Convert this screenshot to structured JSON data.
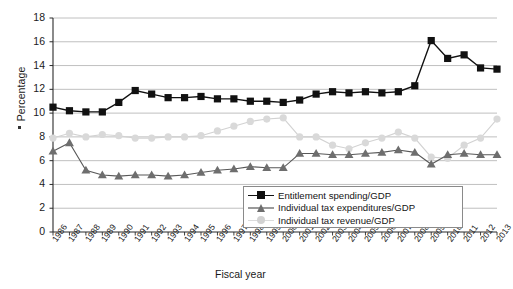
{
  "chart_data": {
    "type": "line",
    "title": "",
    "xlabel": "Fiscal year",
    "ylabel": "Percentage",
    "ylim": [
      0,
      18
    ],
    "ytick_step": 2,
    "yticks": [
      "0",
      "2",
      "4",
      "6",
      "8",
      "10",
      "12",
      "14",
      "16",
      "18"
    ],
    "grid": "horizontal",
    "legend_position": "inside-bottom-right",
    "categories": [
      "1986",
      "1987",
      "1988",
      "1989",
      "1990",
      "1991",
      "1992",
      "1993",
      "1994",
      "1995",
      "1996",
      "1997",
      "1998",
      "1999",
      "2000",
      "2001",
      "2002",
      "2003",
      "2004",
      "2005",
      "2006",
      "2007",
      "2008",
      "2009",
      "2010",
      "2011",
      "2012",
      "2013"
    ],
    "series": [
      {
        "name": "Entitlement spending/GDP",
        "color": "#111111",
        "marker": "square",
        "values": [
          10.5,
          10.2,
          10.1,
          10.1,
          10.9,
          11.9,
          11.6,
          11.3,
          11.3,
          11.4,
          11.2,
          11.2,
          11.0,
          11.0,
          10.9,
          11.1,
          11.6,
          11.8,
          11.7,
          11.8,
          11.7,
          11.8,
          12.3,
          16.1,
          14.6,
          14.9,
          13.8,
          13.7
        ]
      },
      {
        "name": "Individual tax expenditures/GDP",
        "color": "#6e6e6e",
        "marker": "triangle",
        "values": [
          6.8,
          7.5,
          5.2,
          4.8,
          4.7,
          4.8,
          4.8,
          4.7,
          4.8,
          5.0,
          5.2,
          5.3,
          5.5,
          5.4,
          5.4,
          6.6,
          6.6,
          6.5,
          6.5,
          6.6,
          6.7,
          6.9,
          6.7,
          5.7,
          6.5,
          6.6,
          6.5,
          6.5
        ]
      },
      {
        "name": "Individual tax revenue/GDP",
        "color": "#d2d2d2",
        "marker": "circle",
        "values": [
          7.9,
          8.3,
          8.0,
          8.2,
          8.1,
          7.9,
          7.9,
          8.0,
          8.0,
          8.1,
          8.5,
          8.9,
          9.3,
          9.5,
          9.6,
          8.0,
          8.0,
          7.3,
          7.0,
          7.5,
          7.9,
          8.4,
          7.9,
          6.3,
          6.2,
          7.3,
          7.9,
          9.5
        ]
      }
    ]
  },
  "legend": {
    "items": [
      {
        "label": "Entitlement spending/GDP",
        "marker": "square-marker"
      },
      {
        "label": "Individual tax expenditures/GDP",
        "marker": "triangle-marker"
      },
      {
        "label": "Individual tax revenue/GDP",
        "marker": "circle-marker"
      }
    ]
  }
}
